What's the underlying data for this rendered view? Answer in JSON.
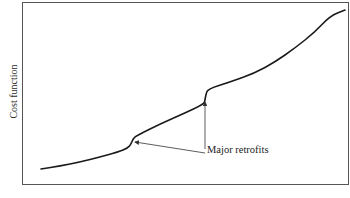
{
  "chart_data": {
    "type": "line",
    "title": "",
    "xlabel": "",
    "ylabel": "Cost function",
    "grid": false,
    "legend": null,
    "axis_ticks": "none",
    "frame": {
      "left": 22,
      "top": 2,
      "right": 349,
      "bottom": 185
    },
    "series": [
      {
        "name": "Cost function",
        "color": "#1a1a1a",
        "points_px": [
          [
            41,
            169
          ],
          [
            60,
            166
          ],
          [
            80,
            162
          ],
          [
            100,
            157
          ],
          [
            118,
            152
          ],
          [
            128,
            148
          ],
          [
            131,
            144
          ],
          [
            133,
            139
          ],
          [
            136,
            136
          ],
          [
            160,
            124
          ],
          [
            185,
            113
          ],
          [
            204,
            104
          ],
          [
            205,
            100
          ],
          [
            206,
            94
          ],
          [
            208,
            89
          ],
          [
            230,
            82
          ],
          [
            255,
            73
          ],
          [
            275,
            62
          ],
          [
            295,
            48
          ],
          [
            315,
            32
          ],
          [
            330,
            16
          ],
          [
            345,
            10
          ]
        ]
      }
    ],
    "annotations": [
      {
        "text": "Major retrofits",
        "position_px": [
          207,
          153
        ],
        "arrows_to_px": [
          [
            135,
            142
          ],
          [
            205,
            102
          ]
        ]
      }
    ]
  },
  "labels": {
    "ylabel": "Cost function",
    "annotation": "Major retrofits"
  }
}
